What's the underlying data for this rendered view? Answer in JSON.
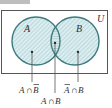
{
  "figure": {
    "header_fragment": "Figure",
    "universe_label": "U",
    "set_a_label": "A",
    "set_b_label": "B",
    "regions": {
      "a_only": {
        "set": "A",
        "op": "∩",
        "set2": "B",
        "complement_second": true
      },
      "intersection": {
        "set": "A",
        "op": "∩",
        "set2": "B"
      },
      "b_only": {
        "set": "A",
        "op": "∩",
        "set2": "B",
        "complement_first": true
      }
    },
    "labels": {
      "a_only_1": "A",
      "a_only_op": "∩",
      "a_only_2": "B",
      "b_only_1": "A",
      "b_only_op": "∩",
      "b_only_2": "B",
      "inter_1": "A",
      "inter_op": "∩",
      "inter_2": "B"
    },
    "colors": {
      "circle_stroke": "#3d7a7f",
      "fill": "#d8eef0",
      "hatch": "#9fb6bb",
      "frame": "#555555"
    }
  }
}
